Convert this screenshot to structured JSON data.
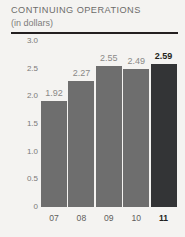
{
  "header": {
    "title": "CONTINUING OPERATIONS",
    "subtitle": "(in dollars)"
  },
  "colors": {
    "background": "#f4f3f1",
    "bar": "#6e6e6e",
    "bar_highlight": "#333436",
    "rule": "#231f20",
    "axis_text": "#7b7a78",
    "label_text": "#8a8987",
    "label_highlight": "#231f20"
  },
  "chart_data": {
    "type": "bar",
    "title": "CONTINUING OPERATIONS",
    "subtitle": "(in dollars)",
    "xlabel": "",
    "ylabel": "",
    "ylim": [
      0,
      3.0
    ],
    "grid": false,
    "legend": "none",
    "categories": [
      "07",
      "08",
      "09",
      "10",
      "11"
    ],
    "values": [
      1.92,
      2.27,
      2.55,
      2.49,
      2.59
    ],
    "value_labels": [
      "1.92",
      "2.27",
      "2.55",
      "2.49",
      "2.59"
    ],
    "highlight_index": 4,
    "yticks": [
      3.0,
      2.5,
      2.0,
      1.5,
      1.0,
      0.5,
      0
    ],
    "ytick_labels": [
      "3.0",
      "2.5",
      "2.0",
      "1.5",
      "1.0",
      "0.5",
      "0"
    ]
  }
}
